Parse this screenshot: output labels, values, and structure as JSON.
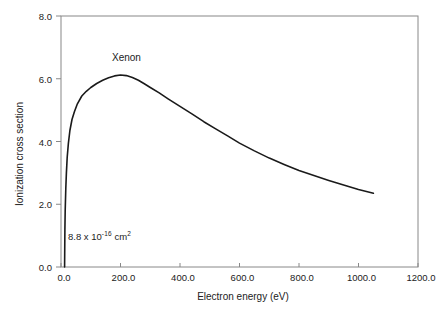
{
  "chart_data": {
    "type": "line",
    "title": "",
    "xlabel": "Electron energy (eV)",
    "ylabel": "Ionization cross section",
    "series_label": "Xenon",
    "annotation": {
      "base": "8.8 x 10",
      "exponent": "-16",
      "unit": " cm",
      "unit_exponent": "2"
    },
    "xlim": [
      0,
      1200
    ],
    "ylim": [
      0,
      8
    ],
    "grid": false,
    "legend_position": "none",
    "xticks": {
      "values": [
        0,
        200,
        400,
        600,
        800,
        1000,
        1200
      ],
      "labels": [
        "0.0",
        "200.0",
        "400.0",
        "600.0",
        "800.0",
        "1000.0",
        "1200.0"
      ]
    },
    "yticks": {
      "values": [
        0,
        2,
        4,
        6,
        8
      ],
      "labels": [
        "0.0",
        "2.0",
        "4.0",
        "6.0",
        "8.0"
      ]
    },
    "series": [
      {
        "name": "Xenon",
        "x": [
          12,
          13,
          14,
          16,
          18,
          21,
          25,
          30,
          37,
          45,
          55,
          70,
          85,
          100,
          120,
          140,
          160,
          180,
          200,
          220,
          240,
          260,
          280,
          300,
          330,
          360,
          400,
          440,
          480,
          520,
          560,
          600,
          650,
          700,
          750,
          800,
          850,
          900,
          950,
          1000,
          1050
        ],
        "y": [
          0,
          1.2,
          1.8,
          2.5,
          3.0,
          3.5,
          3.95,
          4.35,
          4.7,
          4.95,
          5.2,
          5.45,
          5.6,
          5.72,
          5.85,
          5.95,
          6.03,
          6.09,
          6.12,
          6.1,
          6.04,
          5.95,
          5.84,
          5.72,
          5.55,
          5.36,
          5.12,
          4.88,
          4.63,
          4.4,
          4.18,
          3.95,
          3.7,
          3.47,
          3.27,
          3.08,
          2.92,
          2.76,
          2.61,
          2.47,
          2.35
        ]
      }
    ],
    "peak": {
      "x": 200,
      "y": 6.12
    },
    "threshold_x": 12,
    "colors": {
      "curve": "#1a1a1a",
      "frame": "#888888",
      "text": "#222222",
      "background": "#ffffff"
    }
  }
}
